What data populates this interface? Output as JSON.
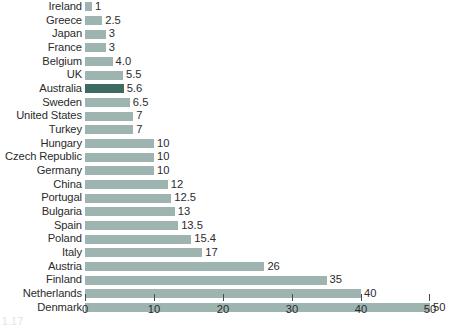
{
  "chart_data": {
    "type": "bar",
    "orientation": "horizontal",
    "title": "",
    "subtitle": "",
    "xlabel": "",
    "ylabel": "",
    "xlim": [
      0,
      50
    ],
    "xticks": [
      0,
      10,
      20,
      30,
      40,
      50
    ],
    "xtick_labels": [
      "0",
      "10",
      "20",
      "30",
      "40",
      "50"
    ],
    "grid": false,
    "legend": null,
    "categories": [
      "Ireland",
      "Greece",
      "Japan",
      "France",
      "Belgium",
      "UK",
      "Australia",
      "Sweden",
      "United States",
      "Turkey",
      "Hungary",
      "Czech Republic",
      "Germany",
      "China",
      "Portugal",
      "Bulgaria",
      "Spain",
      "Poland",
      "Italy",
      "Austria",
      "Finland",
      "Netherlands",
      "Denmark"
    ],
    "values": [
      1,
      2.5,
      3,
      3,
      4.0,
      5.5,
      5.6,
      6.5,
      7,
      7,
      10,
      10,
      10,
      12,
      12.5,
      13,
      13.5,
      15.4,
      17,
      26,
      35,
      40,
      50
    ],
    "value_labels": [
      "1",
      "2.5",
      "3",
      "3",
      "4.0",
      "5.5",
      "5.6",
      "6.5",
      "7",
      "7",
      "10",
      "10",
      "10",
      "12",
      "12.5",
      "13",
      "13.5",
      "15.4",
      "17",
      "26",
      "35",
      "40",
      "50"
    ],
    "highlighted_category": "Australia",
    "colors": {
      "bar": "#9db4b1",
      "bar_highlight": "#3e6b61",
      "axis": "#4a4a4a",
      "text": "#2b2b2b",
      "background": "#ffffff"
    }
  },
  "page_artifact": "1.17"
}
